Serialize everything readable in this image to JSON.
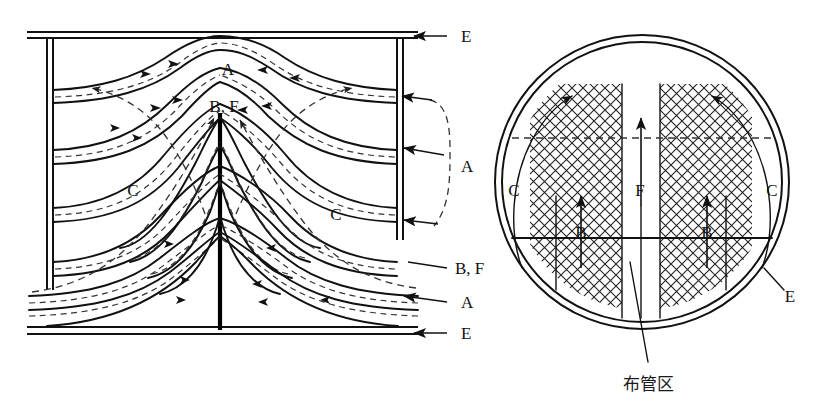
{
  "figure": {
    "type": "engineering-diagram",
    "views": [
      "longitudinal-section",
      "cross-section"
    ]
  },
  "left_view": {
    "name": "longitudinal-section",
    "labels": [
      {
        "id": "A-top",
        "text": "A",
        "x": 228,
        "y": 68
      },
      {
        "id": "BF-center",
        "text": "B, F",
        "x": 224,
        "y": 106
      },
      {
        "id": "C-left",
        "text": "C",
        "x": 133,
        "y": 190
      },
      {
        "id": "C-right",
        "text": "C",
        "x": 336,
        "y": 214
      }
    ],
    "callouts": [
      {
        "id": "E-top",
        "text": "E",
        "x": 463,
        "y": 40
      },
      {
        "id": "A-right",
        "text": "A",
        "x": 463,
        "y": 166
      },
      {
        "id": "BF-right",
        "text": "B, F",
        "x": 463,
        "y": 268
      },
      {
        "id": "A-lower",
        "text": "A",
        "x": 463,
        "y": 302
      },
      {
        "id": "E-bottom",
        "text": "E",
        "x": 463,
        "y": 337
      }
    ]
  },
  "right_view": {
    "name": "cross-section",
    "labels": [
      {
        "id": "C-left",
        "text": "C",
        "x": 514,
        "y": 190
      },
      {
        "id": "F-center",
        "text": "F",
        "x": 640,
        "y": 190
      },
      {
        "id": "C-right",
        "text": "C",
        "x": 772,
        "y": 190
      },
      {
        "id": "B-left",
        "text": "B",
        "x": 581,
        "y": 232
      },
      {
        "id": "B-right",
        "text": "B",
        "x": 707,
        "y": 232
      },
      {
        "id": "E-outer",
        "text": "E",
        "x": 775,
        "y": 296
      }
    ],
    "annotation": {
      "id": "tube-field-callout",
      "text": "布管区",
      "x": 640,
      "y": 387
    }
  },
  "legend_keys": {
    "A": "A",
    "B": "B",
    "C": "C",
    "E": "E",
    "F": "F",
    "BF": "B, F",
    "tube_field": "布管区"
  },
  "colors": {
    "ink": "#111111",
    "dashed": "#333333",
    "background": "#ffffff"
  }
}
